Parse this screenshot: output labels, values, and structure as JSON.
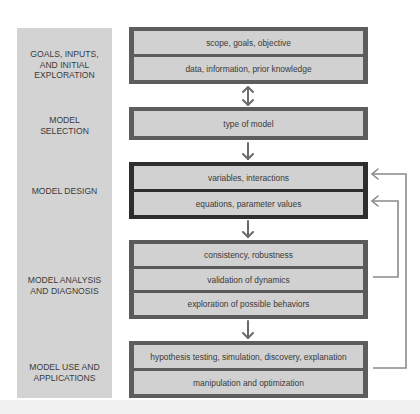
{
  "stages": [
    {
      "id": "goals",
      "label": "GOALS, INPUTS,\nAND INITIAL\nEXPLORATION"
    },
    {
      "id": "selection",
      "label": "MODEL\nSELECTION"
    },
    {
      "id": "design",
      "label": "MODEL DESIGN"
    },
    {
      "id": "analysis",
      "label": "MODEL ANALYSIS\nAND DIAGNOSIS"
    },
    {
      "id": "use",
      "label": "MODEL USE AND\nAPPLICATIONS"
    }
  ],
  "boxes": [
    {
      "id": "goals",
      "rows": [
        "scope, goals, objective",
        "data, information, prior knowledge"
      ]
    },
    {
      "id": "selection",
      "rows": [
        "type of model"
      ]
    },
    {
      "id": "design",
      "rows": [
        "variables, interactions",
        "equations, parameter values"
      ]
    },
    {
      "id": "analysis",
      "rows": [
        "consistency, robustness",
        "validation of dynamics",
        "exploration of possible behaviors"
      ]
    },
    {
      "id": "use",
      "rows": [
        "hypothesis testing, simulation, discovery, explanation",
        "manipulation and optimization"
      ]
    }
  ],
  "connectors": [
    {
      "from": "goals",
      "to": "selection",
      "type": "bidirectional"
    },
    {
      "from": "selection",
      "to": "design",
      "type": "down"
    },
    {
      "from": "design",
      "to": "analysis",
      "type": "down"
    },
    {
      "from": "analysis",
      "to": "use",
      "type": "down"
    },
    {
      "from": "validation of dynamics",
      "to": "equations, parameter values",
      "type": "feedback"
    },
    {
      "from": "hypothesis testing, simulation, discovery, explanation",
      "to": "variables, interactions",
      "type": "feedback"
    }
  ],
  "colors": {
    "stage_bg": "#d3d3d3",
    "row_bg": "#d1d1d1",
    "box_border": "#5d5d5d",
    "design_border": "#2e2e2e",
    "arrow": "#6a6a6a"
  }
}
